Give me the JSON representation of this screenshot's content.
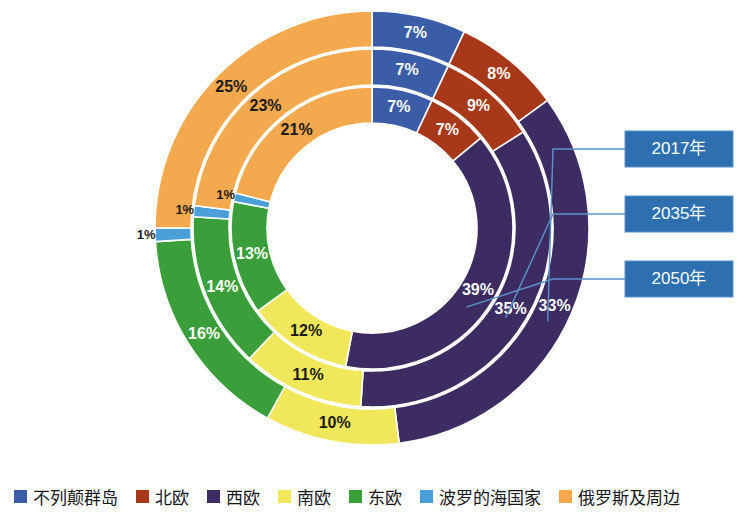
{
  "chart_data": {
    "type": "pie",
    "variant": "multi-ring-donut",
    "title": "",
    "categories": [
      "不列颠群岛",
      "北欧",
      "西欧",
      "南欧",
      "东欧",
      "波罗的海国家",
      "俄罗斯及周边"
    ],
    "colors": [
      "#3b5da7",
      "#a8381a",
      "#3d2c62",
      "#f0e85a",
      "#3a9e3a",
      "#4b9fd8",
      "#f5a94e"
    ],
    "rings": [
      {
        "name": "2017年",
        "ring_index": 0,
        "position": "outer",
        "values": [
          7,
          8,
          33,
          10,
          16,
          1,
          25
        ],
        "labels": [
          "7%",
          "8%",
          "33%",
          "10%",
          "16%",
          "1%",
          "25%"
        ]
      },
      {
        "name": "2035年",
        "ring_index": 1,
        "position": "middle",
        "values": [
          7,
          9,
          35,
          11,
          14,
          1,
          23
        ],
        "labels": [
          "7%",
          "9%",
          "35%",
          "11%",
          "14%",
          "1%",
          "23%"
        ]
      },
      {
        "name": "2050年",
        "ring_index": 2,
        "position": "inner",
        "values": [
          7,
          7,
          39,
          12,
          13,
          1,
          21
        ],
        "labels": [
          "7%",
          "7%",
          "39%",
          "12%",
          "13%",
          "1%",
          "21%"
        ]
      }
    ],
    "series": [
      {
        "name": "2017年",
        "values": [
          7,
          8,
          33,
          10,
          16,
          1,
          25
        ]
      },
      {
        "name": "2035年",
        "values": [
          7,
          9,
          35,
          11,
          14,
          1,
          23
        ]
      },
      {
        "name": "2050年",
        "values": [
          7,
          7,
          39,
          12,
          13,
          1,
          21
        ]
      }
    ],
    "legend": {
      "position": "bottom",
      "entries": [
        {
          "label": "不列颠群岛",
          "color": "#3b5da7"
        },
        {
          "label": "北欧",
          "color": "#a8381a"
        },
        {
          "label": "西欧",
          "color": "#3d2c62"
        },
        {
          "label": "南欧",
          "color": "#f0e85a"
        },
        {
          "label": "东欧",
          "color": "#3a9e3a"
        },
        {
          "label": "波罗的海国家",
          "color": "#4b9fd8"
        },
        {
          "label": "俄罗斯及周边",
          "color": "#f5a94e"
        }
      ]
    },
    "callouts": [
      {
        "label": "2017年",
        "target_ring": "outer"
      },
      {
        "label": "2035年",
        "target_ring": "middle"
      },
      {
        "label": "2050年",
        "target_ring": "inner"
      }
    ],
    "geometry": {
      "center_x": 372,
      "center_y": 228,
      "outer_radius": 217,
      "hole_radius": 105,
      "start_angle_deg": 0,
      "direction": "clockwise"
    },
    "callout_box_color": "#2e6fb0",
    "separator_color": "#ffffff"
  }
}
